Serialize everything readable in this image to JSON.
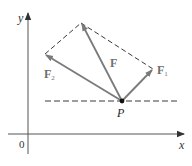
{
  "diagram": {
    "colors": {
      "axis": "#555555",
      "vector": "#7a7a7a",
      "dashed": "#3a3a3a",
      "point": "#111111",
      "background": "#ffffff"
    },
    "axes": {
      "origin_label": "0",
      "x_label": "x",
      "y_label": "y"
    },
    "point": {
      "label": "P"
    },
    "vectors": [
      {
        "id": "F",
        "label": "F",
        "subscript": ""
      },
      {
        "id": "F1",
        "label": "F",
        "subscript": "1"
      },
      {
        "id": "F2",
        "label": "F",
        "subscript": "2"
      }
    ]
  }
}
